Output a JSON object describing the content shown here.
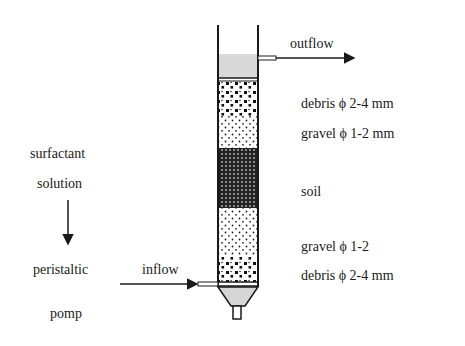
{
  "diagram": {
    "flow_labels": {
      "outflow": "outflow",
      "inflow": "inflow"
    },
    "feed": {
      "line1": "surfactant",
      "line2": "solution",
      "pump_line1": "peristaltic",
      "pump_line2": "pomp"
    },
    "layers": [
      {
        "name": "debris",
        "label": "debris ϕ 2-4 mm",
        "fill": "coarse"
      },
      {
        "name": "gravel",
        "label": "gravel ϕ 1-2 mm",
        "fill": "fine"
      },
      {
        "name": "soil",
        "label": "soil",
        "fill": "dense"
      },
      {
        "name": "gravel",
        "label": "gravel   ϕ   1-2",
        "fill": "fine"
      },
      {
        "name": "debris",
        "label": "debris ϕ 2-4 mm",
        "fill": "coarse"
      }
    ],
    "colors": {
      "liquid": "#d9d9d9",
      "line": "#1a1a1a",
      "funnel": "#d6d6d6"
    }
  }
}
